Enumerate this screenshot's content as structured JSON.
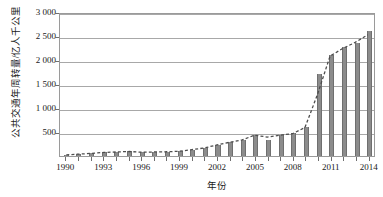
{
  "chart_data": {
    "type": "bar",
    "title": "",
    "xlabel": "年份",
    "ylabel": "公共交通年周转量/亿人千公里",
    "ylim": [
      0,
      3000
    ],
    "ytick_labels": [
      "3 000",
      "2 500",
      "2 000",
      "1 500",
      "1 000",
      "500"
    ],
    "ytick_values": [
      3000,
      2500,
      2000,
      1500,
      1000,
      500
    ],
    "grid": true,
    "legend": "none",
    "xtick_labels": [
      "1990",
      "1993",
      "1996",
      "1999",
      "2002",
      "2005",
      "2008",
      "2011",
      "2014"
    ],
    "xtick_values": [
      1990,
      1993,
      1996,
      1999,
      2002,
      2005,
      2008,
      2011,
      2014
    ],
    "categories": [
      1990,
      1991,
      1992,
      1993,
      1994,
      1995,
      1996,
      1997,
      1998,
      1999,
      2000,
      2001,
      2002,
      2003,
      2004,
      2005,
      2006,
      2007,
      2008,
      2009,
      2010,
      2011,
      2012,
      2013,
      2014
    ],
    "values": [
      25,
      40,
      55,
      75,
      85,
      95,
      80,
      85,
      90,
      100,
      135,
      170,
      235,
      290,
      340,
      440,
      325,
      430,
      470,
      600,
      1710,
      2110,
      2270,
      2350,
      2610
    ],
    "series": [
      {
        "name": "公共交通年周转量",
        "style": "bar",
        "color": "#8c8c8c",
        "values": [
          25,
          40,
          55,
          75,
          85,
          95,
          80,
          85,
          90,
          100,
          135,
          170,
          235,
          290,
          340,
          440,
          325,
          430,
          470,
          600,
          1710,
          2110,
          2270,
          2350,
          2610
        ]
      },
      {
        "name": "趋势线",
        "style": "dashed-line",
        "color": "#4d4d4d",
        "values": [
          25,
          40,
          55,
          75,
          85,
          95,
          80,
          85,
          90,
          100,
          135,
          170,
          235,
          290,
          340,
          440,
          400,
          440,
          470,
          600,
          1300,
          2110,
          2270,
          2400,
          2560
        ]
      }
    ]
  }
}
